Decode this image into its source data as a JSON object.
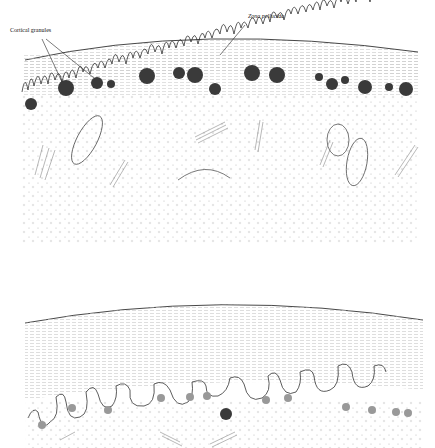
{
  "labels": {
    "cortical_granules": "Cortical granules",
    "zona_pellucida": "Zona pellucida"
  },
  "panels": [
    {
      "name": "top-panel",
      "description": "Oocyte cortex before fertilization: microvilli with cortical granules beneath the plasma membrane"
    },
    {
      "name": "bottom-panel",
      "description": "Oocyte cortex after cortical reaction: granules fused with membrane, contents released into perivitelline space"
    }
  ],
  "colors": {
    "line": "#222222",
    "granule": "#3a3a3a",
    "stipple": "#bbbbbb",
    "organelle": "#777777"
  }
}
